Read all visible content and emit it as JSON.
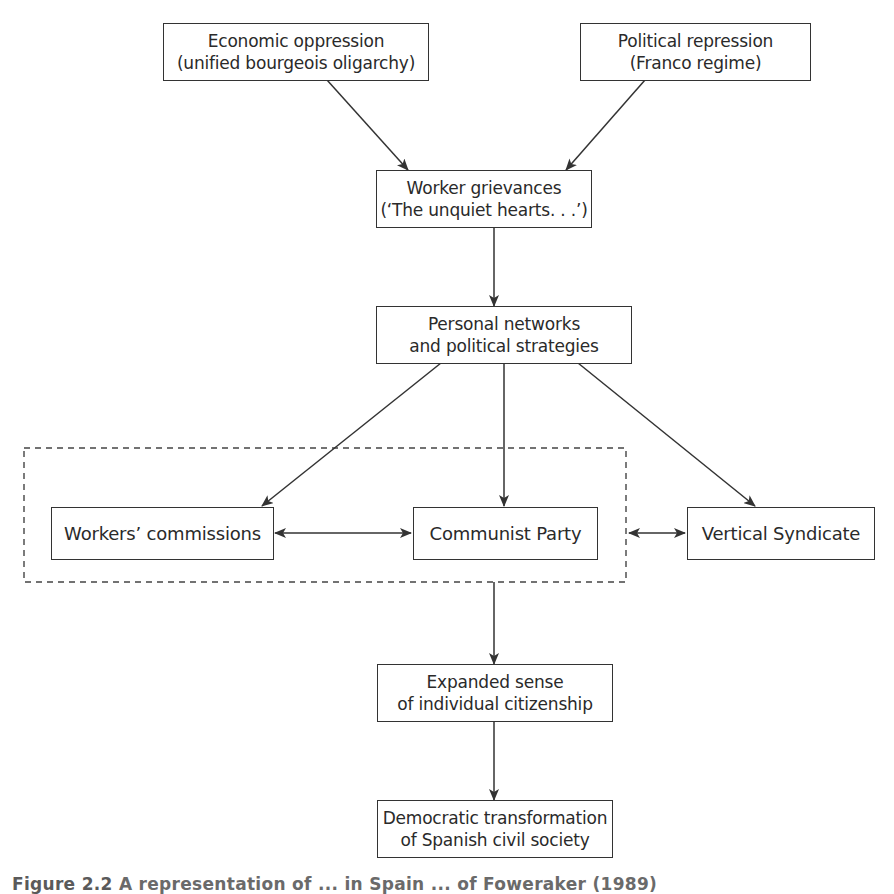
{
  "diagram": {
    "type": "flowchart",
    "nodes": {
      "economic_oppression": {
        "line1": "Economic oppression",
        "line2": "(unified bourgeois oligarchy)"
      },
      "political_repression": {
        "line1": "Political repression",
        "line2": "(Franco regime)"
      },
      "worker_grievances": {
        "line1": "Worker grievances",
        "line2": "(‘The unquiet hearts. . .’)"
      },
      "personal_networks": {
        "line1": "Personal networks",
        "line2": "and political strategies"
      },
      "workers_commissions": {
        "label": "Workers’ commissions"
      },
      "communist_party": {
        "label": "Communist Party"
      },
      "vertical_syndicate": {
        "label": "Vertical Syndicate"
      },
      "expanded_citizenship": {
        "line1": "Expanded sense",
        "line2": "of individual citizenship"
      },
      "democratic_transformation": {
        "line1": "Democratic transformation",
        "line2": "of Spanish civil society"
      }
    },
    "edges": [
      {
        "from": "economic_oppression",
        "to": "worker_grievances",
        "style": "arrow"
      },
      {
        "from": "political_repression",
        "to": "worker_grievances",
        "style": "arrow"
      },
      {
        "from": "worker_grievances",
        "to": "personal_networks",
        "style": "arrow"
      },
      {
        "from": "personal_networks",
        "to": "workers_commissions",
        "style": "arrow"
      },
      {
        "from": "personal_networks",
        "to": "communist_party",
        "style": "arrow"
      },
      {
        "from": "personal_networks",
        "to": "vertical_syndicate",
        "style": "arrow"
      },
      {
        "from": "workers_commissions",
        "to": "communist_party",
        "style": "double-arrow"
      },
      {
        "from": "dashed_group",
        "to": "vertical_syndicate",
        "style": "double-arrow"
      },
      {
        "from": "dashed_group",
        "to": "expanded_citizenship",
        "style": "arrow"
      },
      {
        "from": "expanded_citizenship",
        "to": "democratic_transformation",
        "style": "arrow"
      }
    ],
    "groups": [
      {
        "id": "dashed_group",
        "members": [
          "workers_commissions",
          "communist_party"
        ],
        "border": "dashed"
      }
    ],
    "colors": {
      "stroke": "#333333",
      "text": "#2a2a2a",
      "background": "#ffffff"
    }
  },
  "caption": {
    "figure_label": "Figure 2.2",
    "text": "A representation of ... in Spain ... of Foweraker (1989)"
  }
}
